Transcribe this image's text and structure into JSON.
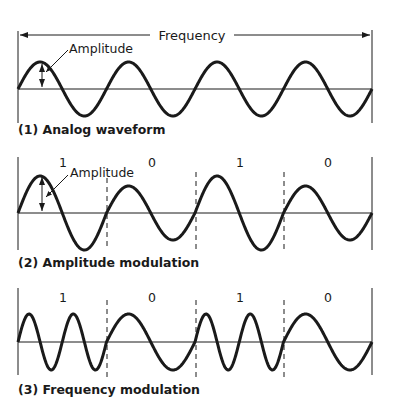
{
  "diagram": {
    "colors": {
      "stroke": "#1a1a1a",
      "background": "#ffffff"
    },
    "panel1": {
      "frequency_label": "Frequency",
      "amplitude_label": "Amplitude",
      "caption": "(1) Analog waveform",
      "cycles": 4
    },
    "panel2": {
      "amplitude_label": "Amplitude",
      "caption": "(2) Amplitude modulation",
      "bits": [
        "1",
        "0",
        "1",
        "0"
      ]
    },
    "panel3": {
      "caption": "(3) Frequency modulation",
      "bits": [
        "1",
        "0",
        "1",
        "0"
      ]
    }
  }
}
